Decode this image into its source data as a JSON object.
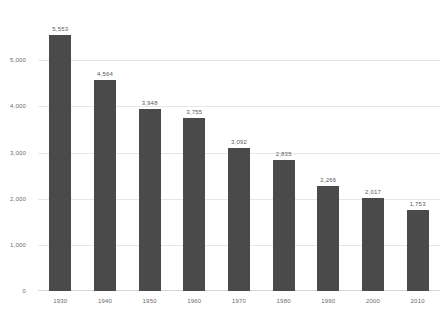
{
  "chart_data": {
    "type": "bar",
    "title": "",
    "subtitle": "",
    "xlabel": "",
    "ylabel": "",
    "categories": [
      "1930",
      "1940",
      "1950",
      "1960",
      "1970",
      "1980",
      "1990",
      "2000",
      "2010"
    ],
    "values": [
      5553,
      4564,
      3948,
      3755,
      3092,
      2835,
      2266,
      2017,
      1753
    ],
    "value_labels": [
      "5,553",
      "4,564",
      "3,948",
      "3,755",
      "3,092",
      "2,835",
      "2,266",
      "2,017",
      "1,753"
    ],
    "ylim": [
      0,
      6000
    ],
    "yticks": [
      0,
      1000,
      2000,
      3000,
      4000,
      5000
    ],
    "ytick_labels": [
      "0",
      "1,000",
      "2,000",
      "3,000",
      "4,000",
      "5,000"
    ],
    "grid": true,
    "legend": false,
    "legend_position": "none",
    "series": [
      {
        "name": "",
        "values": [
          5553,
          4564,
          3948,
          3755,
          3092,
          2835,
          2266,
          2017,
          1753
        ]
      }
    ],
    "colors": {
      "bar": "#4a4a4a",
      "background": "#ffffff",
      "gridline": "#e9e6e2",
      "axis_text": "#6d6a66",
      "value_label": "#5d5a57"
    }
  }
}
